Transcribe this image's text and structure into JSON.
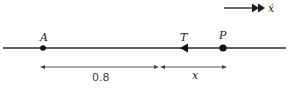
{
  "diagram": {
    "direction_indicator": {
      "label": "ẋ",
      "arrow": "double-arrowhead-right"
    },
    "points": [
      {
        "id": "A",
        "label": "A",
        "marker": "dot"
      },
      {
        "id": "T",
        "label": "T",
        "marker": "arrowhead-left"
      },
      {
        "id": "P",
        "label": "P",
        "marker": "dot"
      }
    ],
    "dimensions": [
      {
        "from": "A",
        "to": "T",
        "label": "0.8"
      },
      {
        "from": "T",
        "to": "P",
        "label": "x"
      }
    ],
    "colors": {
      "line": "#2a2a2a",
      "dimension": "#444444",
      "background": "#ffffff"
    }
  }
}
